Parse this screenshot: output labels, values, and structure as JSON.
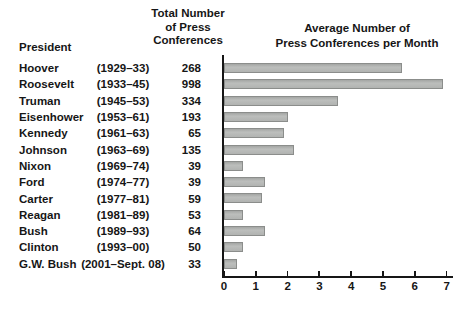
{
  "table": {
    "header_president": "President",
    "header_total_lines": [
      "Total Number",
      "of Press",
      "Conferences"
    ]
  },
  "chart": {
    "title_lines": [
      "Average Number of",
      "Press Conferences per Month"
    ]
  },
  "chart_data": {
    "type": "bar",
    "orientation": "horizontal",
    "title": "Average Number of Press Conferences per Month",
    "categories": [
      "Hoover",
      "Roosevelt",
      "Truman",
      "Eisenhower",
      "Kennedy",
      "Johnson",
      "Nixon",
      "Ford",
      "Carter",
      "Reagan",
      "Bush",
      "Clinton",
      "G.W. Bush"
    ],
    "values": [
      5.6,
      6.9,
      3.6,
      2.0,
      1.9,
      2.2,
      0.6,
      1.3,
      1.2,
      0.6,
      1.3,
      0.6,
      0.4
    ],
    "xlim": [
      0,
      7
    ],
    "xticks": [
      0,
      1,
      2,
      3,
      4,
      5,
      6,
      7
    ],
    "grid": false,
    "legend": "none",
    "rows": [
      {
        "president": "Hoover",
        "years": "(1929–33)",
        "total": "268",
        "avg_per_month": 5.6
      },
      {
        "president": "Roosevelt",
        "years": "(1933–45)",
        "total": "998",
        "avg_per_month": 6.9
      },
      {
        "president": "Truman",
        "years": "(1945–53)",
        "total": "334",
        "avg_per_month": 3.6
      },
      {
        "president": "Eisenhower",
        "years": "(1953–61)",
        "total": "193",
        "avg_per_month": 2.0
      },
      {
        "president": "Kennedy",
        "years": "(1961–63)",
        "total": "65",
        "avg_per_month": 1.9
      },
      {
        "president": "Johnson",
        "years": "(1963–69)",
        "total": "135",
        "avg_per_month": 2.2
      },
      {
        "president": "Nixon",
        "years": "(1969–74)",
        "total": "39",
        "avg_per_month": 0.6
      },
      {
        "president": "Ford",
        "years": "(1974–77)",
        "total": "39",
        "avg_per_month": 1.3
      },
      {
        "president": "Carter",
        "years": "(1977–81)",
        "total": "59",
        "avg_per_month": 1.2
      },
      {
        "president": "Reagan",
        "years": "(1981–89)",
        "total": "53",
        "avg_per_month": 0.6
      },
      {
        "president": "Bush",
        "years": "(1989–93)",
        "total": "64",
        "avg_per_month": 1.3
      },
      {
        "president": "Clinton",
        "years": "(1993–00)",
        "total": "50",
        "avg_per_month": 0.6
      },
      {
        "president": "G.W. Bush",
        "years": "(2001–Sept. 08)",
        "total": "33",
        "avg_per_month": 0.4
      }
    ]
  },
  "colors": {
    "background": "#ffffff",
    "text": "#161616",
    "axis": "#161616",
    "bar_fill": "#bcbebc",
    "bar_border": "#8b8d8b"
  }
}
